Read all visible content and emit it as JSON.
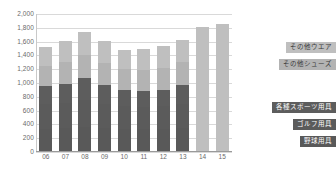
{
  "chart_data": {
    "type": "bar",
    "stacked": true,
    "title": "",
    "xlabel": "",
    "ylabel": "",
    "ylim": [
      0,
      2000
    ],
    "ytick_step": 200,
    "grid": true,
    "legend_position": "right",
    "categories": [
      "06",
      "07",
      "08",
      "09",
      "10",
      "11",
      "12",
      "13",
      "14",
      "15"
    ],
    "ytick_labels": [
      "2,000",
      "1,800",
      "1,600",
      "1,400",
      "1,200",
      "1,000",
      "800",
      "600",
      "400",
      "200",
      "0"
    ],
    "ytick_values": [
      2000,
      1800,
      1600,
      1400,
      1200,
      1000,
      800,
      600,
      400,
      200,
      0
    ],
    "series": [
      {
        "name": "野球用具",
        "color": "#595959",
        "values": [
          340,
          350,
          360,
          345,
          340,
          330,
          340,
          345,
          null,
          null
        ]
      },
      {
        "name": "ゴルフ用具",
        "color": "#5b5b5b",
        "values": [
          350,
          360,
          390,
          350,
          320,
          320,
          320,
          350,
          null,
          null
        ]
      },
      {
        "name": "各種スポーツ用具",
        "color": "#5d5d5d",
        "values": [
          270,
          280,
          320,
          280,
          240,
          240,
          240,
          275,
          null,
          null
        ]
      },
      {
        "name": "その他シューズ",
        "color": "#b3b3b3",
        "values": [
          280,
          310,
          340,
          310,
          300,
          300,
          320,
          330,
          null,
          null
        ]
      },
      {
        "name": "その他ウエア",
        "color": "#bfbfbf",
        "values": [
          280,
          310,
          330,
          320,
          280,
          300,
          320,
          320,
          1810,
          1855
        ]
      }
    ],
    "totals": [
      1520,
      1610,
      1740,
      1605,
      1480,
      1490,
      1540,
      1620,
      1810,
      1855
    ],
    "bars": [
      {
        "category": "06",
        "total": 1520,
        "segments": [
          340,
          690,
          960,
          1240,
          1520
        ]
      },
      {
        "category": "07",
        "total": 1610,
        "segments": [
          350,
          710,
          990,
          1300,
          1610
        ]
      },
      {
        "category": "08",
        "total": 1740,
        "segments": [
          360,
          750,
          1070,
          1410,
          1740
        ]
      },
      {
        "category": "09",
        "total": 1605,
        "segments": [
          345,
          695,
          975,
          1285,
          1605
        ]
      },
      {
        "category": "10",
        "total": 1480,
        "segments": [
          340,
          660,
          900,
          1200,
          1480
        ]
      },
      {
        "category": "11",
        "total": 1490,
        "segments": [
          330,
          650,
          890,
          1190,
          1490
        ]
      },
      {
        "category": "12",
        "total": 1540,
        "segments": [
          340,
          660,
          900,
          1220,
          1540
        ]
      },
      {
        "category": "13",
        "total": 1620,
        "segments": [
          345,
          695,
          970,
          1300,
          1620
        ]
      },
      {
        "category": "14",
        "total": 1810,
        "segments": [
          1810
        ]
      },
      {
        "category": "15",
        "total": 1855,
        "segments": [
          1855
        ]
      }
    ],
    "legend": [
      {
        "label": "その他ウエア",
        "color": "#bfbfbf",
        "text_color": "#3a3a3a"
      },
      {
        "label": "その他シューズ",
        "color": "#b3b3b3",
        "text_color": "#3a3a3a"
      },
      {
        "label": "各種スポーツ用具",
        "color": "#5d5d5d",
        "text_color": "#ffffff"
      },
      {
        "label": "ゴルフ用具",
        "color": "#5b5b5b",
        "text_color": "#ffffff"
      },
      {
        "label": "野球用具",
        "color": "#595959",
        "text_color": "#ffffff"
      }
    ],
    "colors": {
      "grid": "#d9d9d9",
      "axis": "#9a9a9a",
      "tick_text": "#6a6a6a",
      "background": "#ffffff"
    }
  }
}
